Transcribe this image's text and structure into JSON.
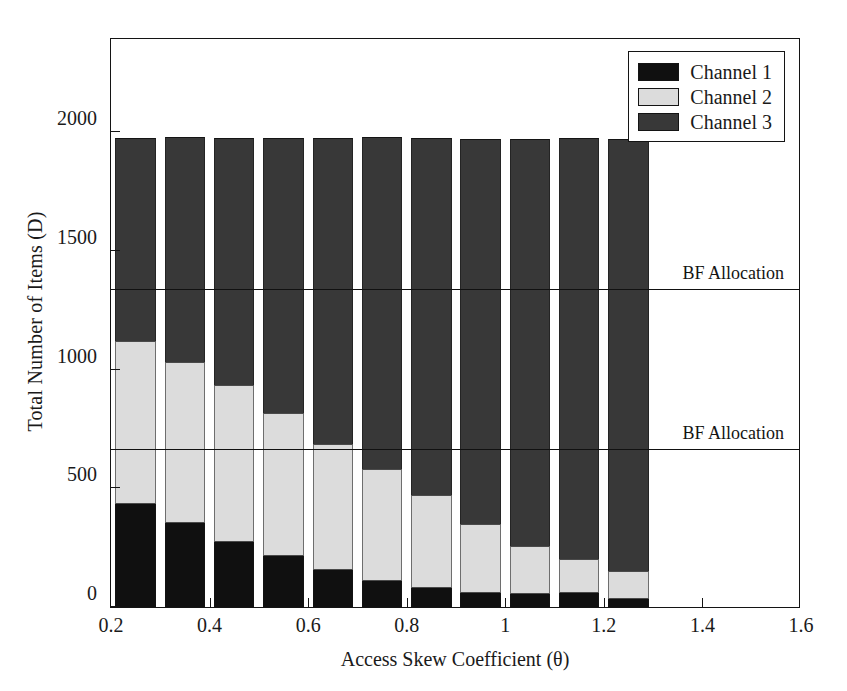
{
  "chart_data": {
    "type": "bar",
    "subtype": "stacked-bar",
    "title": "",
    "xlabel": "Access Skew Coefficient (θ)",
    "ylabel": "Total Number of Items (D)",
    "xlim": [
      0.2,
      1.6
    ],
    "ylim": [
      0,
      2400
    ],
    "xticks": [
      0.2,
      0.4,
      0.6,
      0.8,
      1.0,
      1.2,
      1.4,
      1.6
    ],
    "xticklabels": [
      "0.2",
      "0.4",
      "0.6",
      "0.8",
      "1",
      "1.2",
      "1.4",
      "1.6"
    ],
    "yticks": [
      0,
      500,
      1000,
      1500,
      2000
    ],
    "yticklabels": [
      "0",
      "500",
      "1000",
      "1500",
      "2000"
    ],
    "grid": false,
    "legend_position": "upper right",
    "bar_width": 0.082,
    "x": [
      0.25,
      0.35,
      0.45,
      0.55,
      0.65,
      0.75,
      0.85,
      0.95,
      1.05,
      1.15,
      1.25
    ],
    "series": [
      {
        "name": "Channel 1",
        "color": "#101010",
        "values": [
          435,
          355,
          275,
          215,
          155,
          110,
          80,
          60,
          55,
          58,
          35
        ]
      },
      {
        "name": "Channel 2",
        "color": "#dcdcdc",
        "values": [
          685,
          675,
          660,
          600,
          530,
          470,
          390,
          290,
          200,
          145,
          115
        ]
      },
      {
        "name": "Channel 3",
        "color": "#383838",
        "values": [
          855,
          950,
          1040,
          1160,
          1290,
          1400,
          1505,
          1620,
          1715,
          1772,
          1820
        ]
      }
    ],
    "totals": [
      1975,
      1980,
      1975,
      1975,
      1975,
      1980,
      1975,
      1970,
      1970,
      1975,
      1970
    ],
    "reference_lines": [
      {
        "label": "BF Allocation",
        "value": 1335
      },
      {
        "label": "BF Allocation",
        "value": 660
      }
    ]
  },
  "legend": {
    "items": [
      {
        "label": "Channel 1",
        "swatch": "#101010"
      },
      {
        "label": "Channel 2",
        "swatch": "#dcdcdc"
      },
      {
        "label": "Channel 3",
        "swatch": "#383838"
      }
    ]
  }
}
